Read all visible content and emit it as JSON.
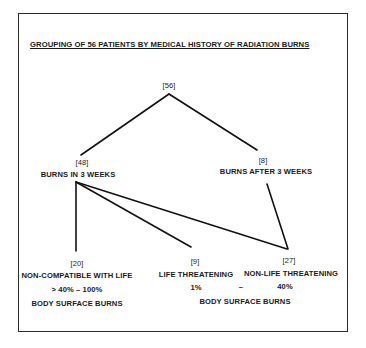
{
  "title": "GROUPING OF 56 PATIENTS BY MEDICAL HISTORY OF RADIATION BURNS",
  "nodes": {
    "root": {
      "count": "[56]"
    },
    "in3weeks": {
      "count": "[48]",
      "label": "BURNS IN 3 WEEKS"
    },
    "after3weeks": {
      "count": "[8]",
      "label": "BURNS AFTER 3 WEEKS"
    },
    "noncompatible": {
      "count": "[20]",
      "label": "NON-COMPATIBLE WITH LIFE",
      "range": "> 40% – 100%",
      "sublabel": "BODY SURFACE BURNS"
    },
    "lifethreat": {
      "count": "[9]",
      "label": "LIFE THREATENING"
    },
    "nonlifethreat": {
      "count": "[27]",
      "label": "NON-LIFE THREATENING"
    },
    "shared_range": {
      "low": "1%",
      "dash": "–",
      "high": "40%",
      "sublabel": "BODY SURFACE BURNS"
    }
  },
  "edges": [
    [
      "root",
      "in3weeks"
    ],
    [
      "root",
      "after3weeks"
    ],
    [
      "in3weeks",
      "noncompatible"
    ],
    [
      "in3weeks",
      "lifethreat"
    ],
    [
      "in3weeks",
      "nonlifethreat"
    ],
    [
      "after3weeks",
      "nonlifethreat"
    ]
  ]
}
